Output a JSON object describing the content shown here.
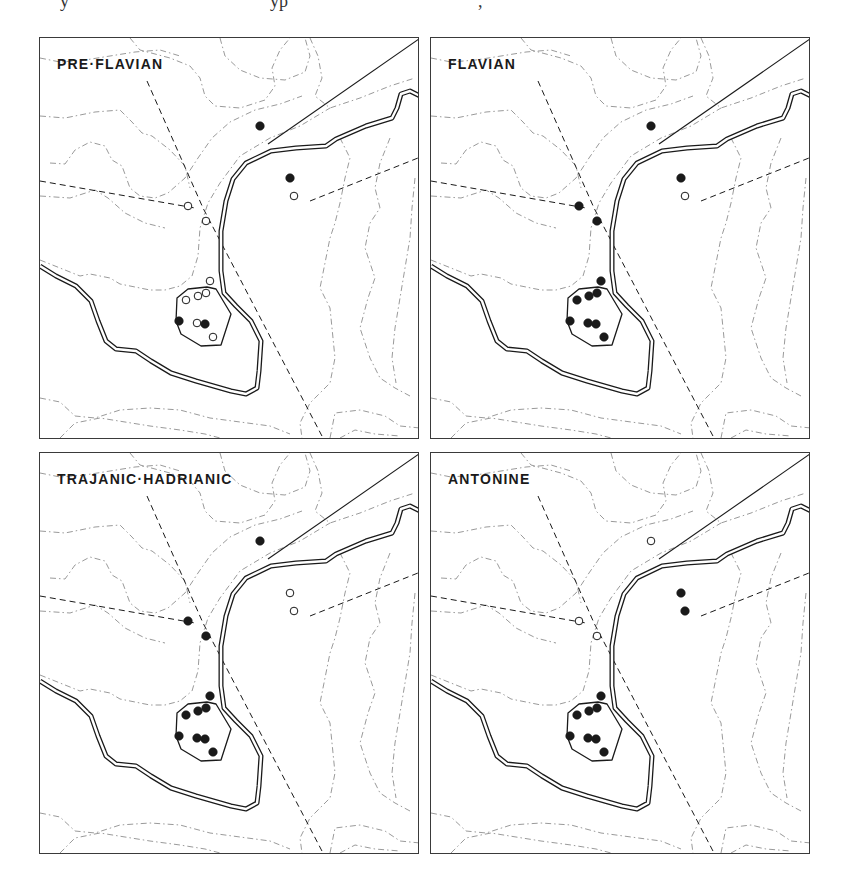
{
  "figure": {
    "top_fragments": [
      "y",
      "yp",
      ","
    ],
    "panels": [
      {
        "id": "pre-flavian",
        "label": "PRE·FLAVIAN",
        "position": {
          "left": 39,
          "top": 37
        },
        "sites": [
          {
            "x": 220,
            "y": 88,
            "type": "filled"
          },
          {
            "x": 250,
            "y": 140,
            "type": "filled"
          },
          {
            "x": 254,
            "y": 158,
            "type": "open"
          },
          {
            "x": 148,
            "y": 168,
            "type": "open"
          },
          {
            "x": 166,
            "y": 183,
            "type": "open"
          },
          {
            "x": 170,
            "y": 243,
            "type": "open"
          },
          {
            "x": 146,
            "y": 262,
            "type": "open"
          },
          {
            "x": 158,
            "y": 258,
            "type": "open"
          },
          {
            "x": 166,
            "y": 255,
            "type": "open"
          },
          {
            "x": 139,
            "y": 283,
            "type": "filled"
          },
          {
            "x": 157,
            "y": 285,
            "type": "open"
          },
          {
            "x": 165,
            "y": 286,
            "type": "filled"
          },
          {
            "x": 173,
            "y": 299,
            "type": "open"
          }
        ]
      },
      {
        "id": "flavian",
        "label": "FLAVIAN",
        "position": {
          "left": 430,
          "top": 37
        },
        "sites": [
          {
            "x": 220,
            "y": 88,
            "type": "filled"
          },
          {
            "x": 250,
            "y": 140,
            "type": "filled"
          },
          {
            "x": 254,
            "y": 158,
            "type": "open"
          },
          {
            "x": 148,
            "y": 168,
            "type": "filled"
          },
          {
            "x": 166,
            "y": 183,
            "type": "filled"
          },
          {
            "x": 170,
            "y": 243,
            "type": "filled"
          },
          {
            "x": 146,
            "y": 262,
            "type": "filled"
          },
          {
            "x": 158,
            "y": 258,
            "type": "filled"
          },
          {
            "x": 166,
            "y": 255,
            "type": "filled"
          },
          {
            "x": 139,
            "y": 283,
            "type": "filled"
          },
          {
            "x": 157,
            "y": 285,
            "type": "filled"
          },
          {
            "x": 165,
            "y": 286,
            "type": "filled"
          },
          {
            "x": 173,
            "y": 299,
            "type": "filled"
          }
        ]
      },
      {
        "id": "trajanic-hadrianic",
        "label": "TRAJANIC·HADRIANIC",
        "position": {
          "left": 39,
          "top": 452
        },
        "sites": [
          {
            "x": 220,
            "y": 88,
            "type": "filled"
          },
          {
            "x": 250,
            "y": 140,
            "type": "open"
          },
          {
            "x": 254,
            "y": 158,
            "type": "open"
          },
          {
            "x": 148,
            "y": 168,
            "type": "filled"
          },
          {
            "x": 166,
            "y": 183,
            "type": "filled"
          },
          {
            "x": 170,
            "y": 243,
            "type": "filled"
          },
          {
            "x": 146,
            "y": 262,
            "type": "filled"
          },
          {
            "x": 158,
            "y": 258,
            "type": "filled"
          },
          {
            "x": 166,
            "y": 255,
            "type": "filled"
          },
          {
            "x": 139,
            "y": 283,
            "type": "filled"
          },
          {
            "x": 157,
            "y": 285,
            "type": "filled"
          },
          {
            "x": 165,
            "y": 286,
            "type": "filled"
          },
          {
            "x": 173,
            "y": 299,
            "type": "filled"
          }
        ]
      },
      {
        "id": "antonine",
        "label": "ANTONINE",
        "position": {
          "left": 430,
          "top": 452
        },
        "sites": [
          {
            "x": 220,
            "y": 88,
            "type": "open"
          },
          {
            "x": 250,
            "y": 140,
            "type": "filled"
          },
          {
            "x": 254,
            "y": 158,
            "type": "filled"
          },
          {
            "x": 148,
            "y": 168,
            "type": "open"
          },
          {
            "x": 166,
            "y": 183,
            "type": "open"
          },
          {
            "x": 170,
            "y": 243,
            "type": "filled"
          },
          {
            "x": 146,
            "y": 262,
            "type": "filled"
          },
          {
            "x": 158,
            "y": 258,
            "type": "filled"
          },
          {
            "x": 166,
            "y": 255,
            "type": "filled"
          },
          {
            "x": 139,
            "y": 283,
            "type": "filled"
          },
          {
            "x": 157,
            "y": 285,
            "type": "filled"
          },
          {
            "x": 165,
            "y": 286,
            "type": "filled"
          },
          {
            "x": 173,
            "y": 299,
            "type": "filled"
          }
        ]
      }
    ],
    "legend_symbols": {
      "filled": "occupied site (filled circle)",
      "open": "unoccupied site (open circle)"
    },
    "colors": {
      "ink": "#1a1a1a",
      "contour": "#9a9a9a",
      "frame": "#3a3a3a"
    }
  }
}
